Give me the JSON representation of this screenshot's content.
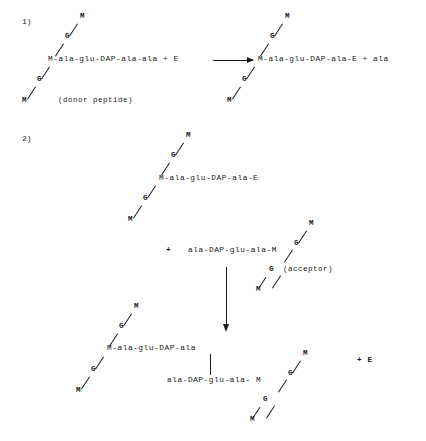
{
  "figure": {
    "type": "biochemical-reaction-diagram",
    "background_color": "#ffffff",
    "ink_color": "#1a1a1a"
  },
  "steps": [
    {
      "id": "step-1",
      "label": "1)"
    },
    {
      "id": "step-2",
      "label": "2)"
    }
  ],
  "residues": {
    "m": "M",
    "g": "G"
  },
  "step1": {
    "donor": {
      "chain": "M-ala-glu-DAP-ala-ala + E",
      "note": "(donor peptide)",
      "glycan": [
        "M",
        "G",
        "M",
        "G",
        "M"
      ]
    },
    "product": {
      "chain": "M-ala-glu-DAP-ala-E + ala",
      "glycan": [
        "M",
        "G",
        "M",
        "G",
        "M"
      ]
    },
    "arrow": "reaction-arrow-right"
  },
  "step2": {
    "donor": {
      "chain": "M-ala-glu-DAP-ala-E",
      "glycan": [
        "M",
        "G",
        "M",
        "G",
        "M"
      ]
    },
    "plus": "+",
    "acceptor": {
      "chain": "ala-DAP-glu-ala-M",
      "note": "(acceptor)",
      "glycan": [
        "M",
        "G",
        "M",
        "G",
        "M"
      ]
    },
    "arrow": "reaction-arrow-down",
    "product": {
      "left_chain": "M-ala-glu-DAP-ala",
      "right_chain": "ala-DAP-glu-ala- M",
      "crosslink": "vertical-bond",
      "left_glycan": [
        "M",
        "G",
        "M",
        "G",
        "M"
      ],
      "right_glycan": [
        "M",
        "G",
        "M",
        "G",
        "M"
      ],
      "released_enzyme": "+ E"
    }
  }
}
